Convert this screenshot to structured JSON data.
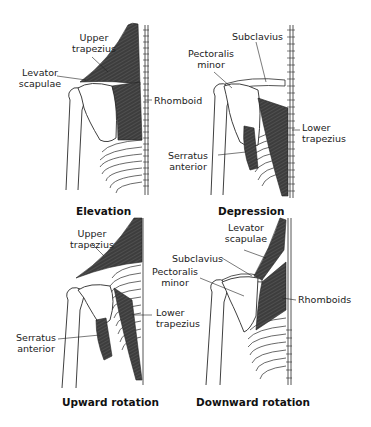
{
  "figure": {
    "panels": [
      {
        "id": "elevation",
        "caption": "Elevation",
        "labels": [
          {
            "id": "upper-trapezius",
            "line1": "Upper",
            "line2": "trapezius"
          },
          {
            "id": "levator-scapulae",
            "line1": "Levator",
            "line2": "scapulae"
          },
          {
            "id": "rhomboid",
            "line1": "Rhomboid"
          }
        ]
      },
      {
        "id": "depression",
        "caption": "Depression",
        "labels": [
          {
            "id": "subclavius",
            "line1": "Subclavius"
          },
          {
            "id": "pectoralis-minor",
            "line1": "Pectoralis",
            "line2": "minor"
          },
          {
            "id": "lower-trapezius",
            "line1": "Lower",
            "line2": "trapezius"
          },
          {
            "id": "serratus-anterior",
            "line1": "Serratus",
            "line2": "anterior"
          }
        ]
      },
      {
        "id": "upward-rotation",
        "caption": "Upward rotation",
        "labels": [
          {
            "id": "upper-trapezius",
            "line1": "Upper",
            "line2": "trapezius"
          },
          {
            "id": "lower-trapezius",
            "line1": "Lower",
            "line2": "trapezius"
          },
          {
            "id": "serratus-anterior",
            "line1": "Serratus",
            "line2": "anterior"
          }
        ]
      },
      {
        "id": "downward-rotation",
        "caption": "Downward rotation",
        "labels": [
          {
            "id": "levator-scapulae",
            "line1": "Levator",
            "line2": "scapulae"
          },
          {
            "id": "subclavius",
            "line1": "Subclavius"
          },
          {
            "id": "pectoralis-minor",
            "line1": "Pectoralis",
            "line2": "minor"
          },
          {
            "id": "rhomboids",
            "line1": "Rhomboids"
          }
        ]
      }
    ],
    "colors": {
      "muscle": "#3d3d3d",
      "bone_stroke": "#2a2a2a",
      "background": "#ffffff"
    }
  }
}
